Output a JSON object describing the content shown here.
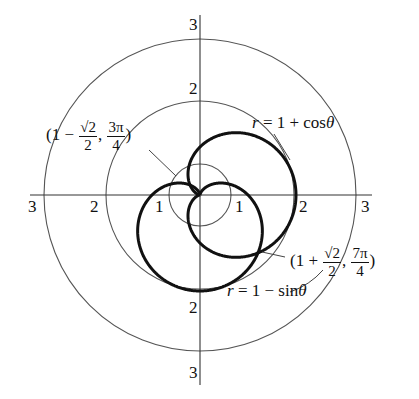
{
  "figure": {
    "origin_px": [
      200,
      195
    ],
    "unit_px": 48,
    "grid_circles": [
      {
        "label": "1",
        "radius_px": 31
      },
      {
        "label": "2",
        "radius_px": 94
      },
      {
        "label": "3",
        "radius_px": 156
      }
    ],
    "axis_labels": {
      "left_3": "3",
      "left_2": "2",
      "left_1": "1",
      "right_1": "1",
      "right_2": "2",
      "right_3": "3",
      "top_3": "3",
      "top_2": "2",
      "bottom_2": "2",
      "bottom_3": "3"
    },
    "curves": [
      {
        "name": "cardioid-cos",
        "equation_lhs": "r",
        "equation_rhs": "= 1 + cos",
        "theta": "θ"
      },
      {
        "name": "cardioid-sin",
        "equation_lhs": "r",
        "equation_rhs": "= 1 − sin",
        "theta": "θ"
      }
    ],
    "points": [
      {
        "prefix": "(1 − ",
        "num1": "√2",
        "den1": "2",
        "sep": ", ",
        "num2": "3π",
        "den2": "4",
        "suffix": ")"
      },
      {
        "prefix": "(1 + ",
        "num1": "√2",
        "den1": "2",
        "sep": ", ",
        "num2": "7π",
        "den2": "4",
        "suffix": ")"
      }
    ]
  }
}
